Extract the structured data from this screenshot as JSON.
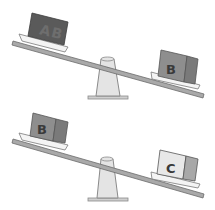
{
  "scales": [
    {
      "id": "top",
      "left_box": {
        "label": "A",
        "color": "#5a5a5a",
        "side_color": "#4a4a4a",
        "text_color": "#6e6e6e"
      },
      "right_box": {
        "label": "B",
        "color": "#8e8e8e",
        "side_color": "#7a7a7a",
        "text_color": "#3a3a3a"
      },
      "tilt": "right side down"
    },
    {
      "id": "bottom",
      "left_box": {
        "label": "B",
        "color": "#8e8e8e",
        "side_color": "#7a7a7a",
        "text_color": "#3a3a3a"
      },
      "right_box": {
        "label": "C",
        "color": "#e8e8e8",
        "side_color": "#a8a8a8",
        "text_color": "#3a3a3a"
      },
      "tilt": "right side down"
    }
  ],
  "colors": {
    "beam": "#a9a9a9",
    "beam_edge": "#6b6b6b",
    "plate": "#f4f4f4",
    "fulcrum": "#e4e4e4",
    "fulcrum_edge": "#8a8a8a"
  }
}
